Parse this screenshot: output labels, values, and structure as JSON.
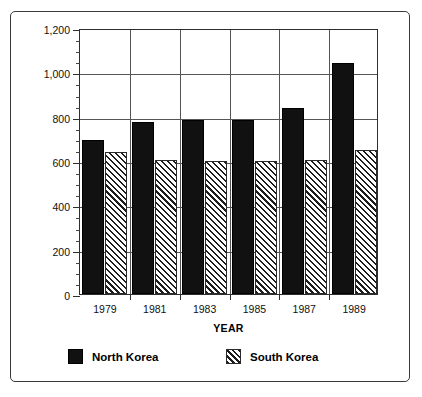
{
  "chart_data": {
    "type": "bar",
    "title": "",
    "subtitle": "",
    "xlabel": "YEAR",
    "ylabel": "PERSONNEL IN THOUSANDS",
    "categories": [
      "1979",
      "1981",
      "1983",
      "1985",
      "1987",
      "1989"
    ],
    "series": [
      {
        "name": "North Korea",
        "fill": "solid-black",
        "color": "#111111",
        "values": [
          695,
          775,
          785,
          785,
          840,
          1040
        ]
      },
      {
        "name": "South Korea",
        "fill": "diagonal-hatch",
        "color": "#1d1d1d",
        "values": [
          640,
          605,
          600,
          600,
          605,
          650
        ]
      }
    ],
    "ylim": [
      0,
      1200
    ],
    "ytick_values": [
      0,
      200,
      400,
      600,
      800,
      1000,
      1200
    ],
    "ytick_labels": [
      "0",
      "200",
      "400",
      "600",
      "800",
      "1,000",
      "1,200"
    ],
    "yminor_step": 50,
    "grid": "horizontal-major-and-group-separators",
    "legend_position": "bottom",
    "legend_entries": [
      "North Korea",
      "South Korea"
    ]
  },
  "frame": {
    "border_color": "#3a3a3a",
    "background": "#ffffff"
  }
}
